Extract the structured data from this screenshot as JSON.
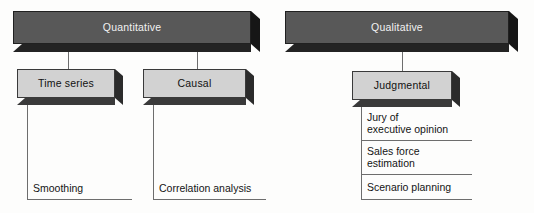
{
  "diagram": {
    "colors": {
      "header_bar_fill": "#585858",
      "header_bar_text": "#f2f2f2",
      "sub_box_fill": "#d2d2d2",
      "sub_box_text": "#111111",
      "connector_line": "#6d6d6d",
      "leaf_text": "#141414",
      "background": "#fdfdfc"
    },
    "branches": [
      {
        "id": "quantitative",
        "header": "Quantitative",
        "children": [
          {
            "id": "time-series",
            "label": "Time series",
            "leaves": [
              "Smoothing"
            ]
          },
          {
            "id": "causal",
            "label": "Causal",
            "leaves": [
              "Correlation analysis"
            ]
          }
        ]
      },
      {
        "id": "qualitative",
        "header": "Qualitative",
        "children": [
          {
            "id": "judgmental",
            "label": "Judgmental",
            "leaves": [
              "Jury of executive opinion",
              "Sales force estimation",
              "Scenario planning"
            ]
          }
        ]
      }
    ],
    "leaf_lines": {
      "jury_line1": "Jury of",
      "jury_line2": "executive opinion",
      "sales_line1": "Sales force",
      "sales_line2": "estimation",
      "scenario_line1": "Scenario planning",
      "smoothing": "Smoothing",
      "correlation": "Correlation analysis"
    }
  }
}
